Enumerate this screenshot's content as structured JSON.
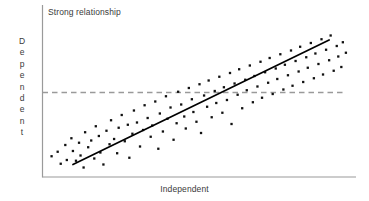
{
  "chart_data": {
    "type": "scatter",
    "title": "Strong relationship",
    "xlabel": "Independent",
    "ylabel": "Dependent",
    "ylabel_letters": [
      "D",
      "e",
      "p",
      "e",
      "n",
      "d",
      "e",
      "n",
      "t"
    ],
    "grid": false,
    "legend": null,
    "xlim": [
      0,
      100
    ],
    "ylim": [
      0,
      100
    ],
    "axis_ticks": {
      "x": [],
      "y": []
    },
    "colors": {
      "point": "#111111",
      "axis": "#9a9a9a",
      "trend_line": "#000000",
      "reference_line": "#9a9a9a",
      "text": "#3a3a3a",
      "background": "#ffffff"
    },
    "annotations": [
      {
        "name": "trend-line",
        "type": "line",
        "style": "solid",
        "x": [
          8.5,
          92.5
        ],
        "y": [
          5.0,
          88.0
        ]
      },
      {
        "name": "reference-line",
        "type": "line",
        "style": "dashed",
        "orientation": "horizontal",
        "y": 53.0,
        "x": [
          0,
          97.5
        ]
      }
    ],
    "points": [
      [
        1.5,
        10.5
      ],
      [
        3.5,
        13.5
      ],
      [
        4.5,
        5.5
      ],
      [
        6.0,
        18.0
      ],
      [
        6.5,
        8.0
      ],
      [
        8.0,
        22.5
      ],
      [
        8.5,
        14.0
      ],
      [
        9.5,
        7.5
      ],
      [
        10.5,
        19.5
      ],
      [
        11.0,
        11.0
      ],
      [
        12.0,
        3.0
      ],
      [
        12.5,
        26.5
      ],
      [
        13.5,
        16.5
      ],
      [
        14.5,
        21.0
      ],
      [
        15.5,
        9.0
      ],
      [
        16.0,
        30.5
      ],
      [
        17.0,
        24.0
      ],
      [
        17.5,
        13.0
      ],
      [
        18.5,
        5.0
      ],
      [
        19.5,
        27.5
      ],
      [
        20.5,
        18.5
      ],
      [
        21.0,
        34.5
      ],
      [
        22.0,
        22.0
      ],
      [
        23.0,
        12.5
      ],
      [
        23.5,
        29.5
      ],
      [
        24.5,
        38.0
      ],
      [
        25.5,
        20.5
      ],
      [
        26.5,
        31.5
      ],
      [
        27.0,
        9.5
      ],
      [
        28.0,
        25.5
      ],
      [
        28.5,
        41.0
      ],
      [
        29.5,
        33.0
      ],
      [
        30.5,
        17.0
      ],
      [
        31.5,
        28.0
      ],
      [
        32.0,
        44.5
      ],
      [
        33.0,
        36.0
      ],
      [
        34.0,
        23.5
      ],
      [
        34.5,
        31.0
      ],
      [
        35.5,
        47.0
      ],
      [
        36.5,
        15.5
      ],
      [
        37.0,
        39.0
      ],
      [
        38.0,
        27.0
      ],
      [
        39.0,
        50.5
      ],
      [
        39.5,
        35.5
      ],
      [
        40.5,
        43.0
      ],
      [
        41.5,
        21.5
      ],
      [
        42.5,
        32.5
      ],
      [
        43.0,
        53.5
      ],
      [
        44.0,
        45.0
      ],
      [
        45.0,
        37.0
      ],
      [
        45.5,
        29.0
      ],
      [
        46.5,
        56.0
      ],
      [
        47.5,
        48.5
      ],
      [
        48.0,
        40.0
      ],
      [
        49.0,
        33.5
      ],
      [
        50.0,
        58.5
      ],
      [
        50.5,
        26.0
      ],
      [
        51.5,
        51.0
      ],
      [
        52.5,
        43.5
      ],
      [
        53.0,
        61.0
      ],
      [
        54.0,
        36.5
      ],
      [
        55.0,
        54.0
      ],
      [
        55.5,
        46.0
      ],
      [
        56.5,
        63.5
      ],
      [
        57.5,
        39.5
      ],
      [
        58.0,
        56.5
      ],
      [
        59.0,
        48.0
      ],
      [
        60.0,
        66.0
      ],
      [
        60.5,
        32.0
      ],
      [
        61.5,
        59.0
      ],
      [
        62.5,
        51.5
      ],
      [
        63.0,
        68.5
      ],
      [
        64.0,
        42.5
      ],
      [
        65.0,
        61.5
      ],
      [
        65.5,
        54.5
      ],
      [
        66.5,
        71.0
      ],
      [
        67.5,
        46.5
      ],
      [
        68.0,
        64.0
      ],
      [
        69.0,
        57.0
      ],
      [
        70.0,
        73.5
      ],
      [
        70.5,
        49.5
      ],
      [
        71.5,
        66.5
      ],
      [
        72.5,
        59.5
      ],
      [
        73.0,
        76.0
      ],
      [
        74.0,
        52.0
      ],
      [
        75.0,
        69.0
      ],
      [
        75.5,
        62.0
      ],
      [
        76.5,
        78.5
      ],
      [
        77.5,
        55.0
      ],
      [
        78.0,
        71.5
      ],
      [
        79.0,
        64.5
      ],
      [
        80.0,
        81.0
      ],
      [
        80.5,
        57.5
      ],
      [
        81.5,
        74.0
      ],
      [
        82.5,
        67.0
      ],
      [
        83.0,
        83.5
      ],
      [
        84.0,
        60.0
      ],
      [
        85.0,
        76.5
      ],
      [
        85.5,
        69.5
      ],
      [
        86.5,
        86.0
      ],
      [
        87.5,
        62.5
      ],
      [
        88.0,
        79.0
      ],
      [
        89.0,
        72.0
      ],
      [
        90.0,
        88.5
      ],
      [
        90.5,
        65.0
      ],
      [
        91.5,
        81.5
      ],
      [
        92.5,
        74.5
      ],
      [
        93.0,
        91.0
      ],
      [
        94.0,
        67.5
      ],
      [
        95.0,
        84.0
      ],
      [
        95.5,
        77.0
      ],
      [
        96.5,
        70.0
      ],
      [
        97.0,
        86.5
      ],
      [
        98.0,
        79.5
      ]
    ]
  }
}
